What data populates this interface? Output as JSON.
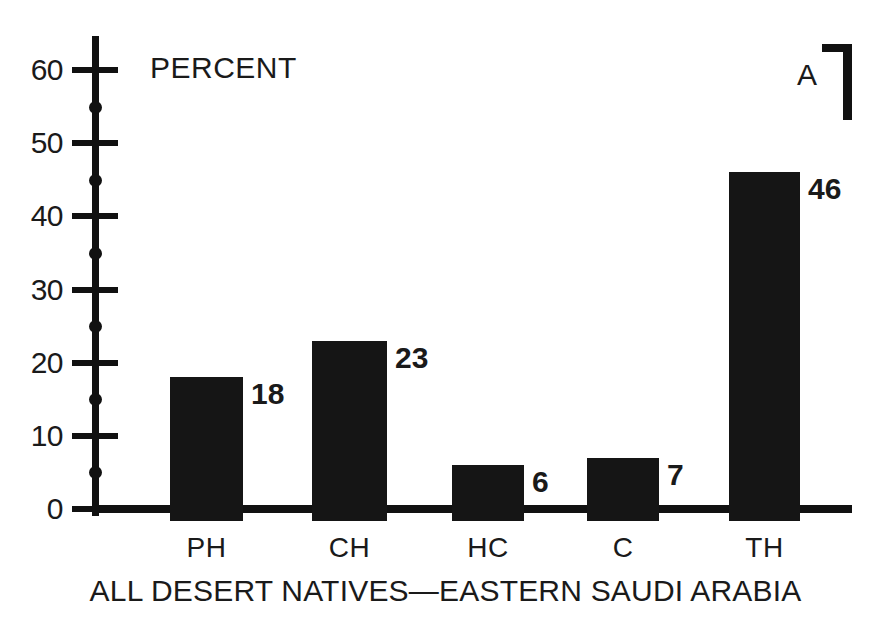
{
  "chart_data": {
    "type": "bar",
    "title": "",
    "panel_label": "A",
    "categories": [
      "PH",
      "CH",
      "HC",
      "C",
      "TH"
    ],
    "values": [
      18,
      23,
      6,
      7,
      46
    ],
    "value_labels": [
      "18",
      "23",
      "6",
      "7",
      "46"
    ],
    "xlabel": "ALL DESERT NATIVES—EASTERN SAUDI ARABIA",
    "ylabel": "PERCENT",
    "ylim": [
      0,
      60
    ],
    "y_major_ticks": [
      0,
      10,
      20,
      30,
      40,
      50,
      60
    ],
    "y_major_tick_labels": [
      "0",
      "10",
      "20",
      "30",
      "40",
      "50",
      "60"
    ],
    "y_minor_ticks": [
      5,
      15,
      25,
      35,
      45,
      55
    ],
    "grid": false,
    "legend": "none",
    "bar_color": "#151515",
    "axis_color": "#111111",
    "background_color": "#ffffff"
  },
  "figure": {
    "axis_title": "PERCENT",
    "caption": "ALL DESERT NATIVES—EASTERN SAUDI ARABIA",
    "panel_letter": "A"
  }
}
